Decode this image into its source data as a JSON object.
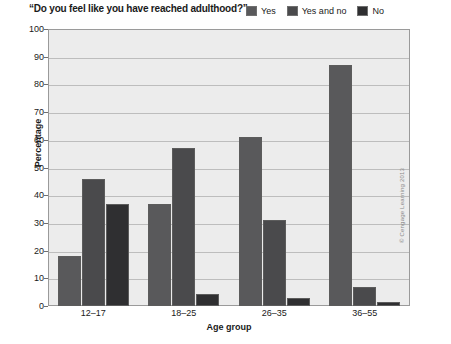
{
  "chart_data": {
    "type": "bar",
    "title": "“Do you feel like you have reached adulthood?”",
    "xlabel": "Age group",
    "ylabel": "Percentage",
    "ylim": [
      0,
      100
    ],
    "ytick_step": 10,
    "grid": true,
    "legend_position": "top-right",
    "categories": [
      "12–17",
      "18–25",
      "26–35",
      "36–55"
    ],
    "yticks": [
      "100",
      "90",
      "80",
      "70",
      "60",
      "50",
      "40",
      "30",
      "20",
      "10",
      "0"
    ],
    "series": [
      {
        "name": "Yes",
        "color": "#59595b",
        "values": [
          18,
          37,
          61,
          87
        ]
      },
      {
        "name": "Yes and no",
        "color": "#4a4a4c",
        "values": [
          46,
          57,
          31,
          7
        ]
      },
      {
        "name": "No",
        "color": "#2f2f31",
        "values": [
          37,
          4.5,
          3,
          1.5
        ]
      }
    ]
  },
  "credit": {
    "text": "© Cengage Learning 2013"
  },
  "colors": {
    "plot_background": "#ececec",
    "gridline": "#bdbdbd",
    "frame": "#9a9a9a",
    "text": "#1a1a1a"
  }
}
